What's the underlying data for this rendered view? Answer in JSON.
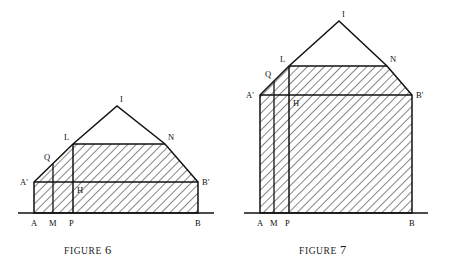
{
  "page": {
    "background": "#ffffff",
    "ink": "#111111",
    "hatch_color": "#2b2b2b",
    "width": 454,
    "height": 268
  },
  "figures": [
    {
      "id": "figure-6",
      "caption_prefix": "FIGURE",
      "caption_number": "6",
      "points": {
        "A": {
          "x": 34,
          "y": 213,
          "label": "A",
          "lx": 31,
          "ly": 226
        },
        "M": {
          "x": 53,
          "y": 213,
          "label": "M",
          "lx": 49,
          "ly": 226
        },
        "P": {
          "x": 73,
          "y": 213,
          "label": "P",
          "lx": 69,
          "ly": 226
        },
        "B": {
          "x": 198,
          "y": 213,
          "label": "B",
          "lx": 195,
          "ly": 226
        },
        "A2": {
          "x": 34,
          "y": 182,
          "label": "A'",
          "lx": 20,
          "ly": 185
        },
        "B2": {
          "x": 198,
          "y": 182,
          "label": "B'",
          "lx": 202,
          "ly": 185
        },
        "Q": {
          "x": 53,
          "y": 164,
          "label": "Q",
          "lx": 44,
          "ly": 160
        },
        "L": {
          "x": 73,
          "y": 144,
          "label": "L",
          "lx": 64,
          "ly": 140
        },
        "N": {
          "x": 165,
          "y": 144,
          "label": "N",
          "lx": 168,
          "ly": 140
        },
        "I": {
          "x": 117,
          "y": 106,
          "label": "I",
          "lx": 120,
          "ly": 102
        },
        "H": {
          "x": 73,
          "y": 182,
          "label": "H",
          "lx": 77,
          "ly": 193
        }
      },
      "baseline": {
        "x1": 18,
        "x2": 214,
        "y": 213
      },
      "shaded_polygon": "A,A2,L,N,B2,B",
      "unshaded_triangle": "L,I,N"
    },
    {
      "id": "figure-7",
      "caption_prefix": "FIGURE",
      "caption_number": "7",
      "points": {
        "A": {
          "x": 260,
          "y": 213,
          "label": "A",
          "lx": 257,
          "ly": 226
        },
        "M": {
          "x": 274,
          "y": 213,
          "label": "M",
          "lx": 270,
          "ly": 226
        },
        "P": {
          "x": 289,
          "y": 213,
          "label": "P",
          "lx": 285,
          "ly": 226
        },
        "B": {
          "x": 412,
          "y": 213,
          "label": "B",
          "lx": 409,
          "ly": 226
        },
        "A2": {
          "x": 260,
          "y": 95,
          "label": "A'",
          "lx": 246,
          "ly": 98
        },
        "B2": {
          "x": 412,
          "y": 95,
          "label": "B'",
          "lx": 416,
          "ly": 98
        },
        "Q": {
          "x": 274,
          "y": 81,
          "label": "Q",
          "lx": 265,
          "ly": 77
        },
        "L": {
          "x": 289,
          "y": 66,
          "label": "L",
          "lx": 280,
          "ly": 62
        },
        "N": {
          "x": 387,
          "y": 66,
          "label": "N",
          "lx": 390,
          "ly": 62
        },
        "I": {
          "x": 339,
          "y": 21,
          "label": "I",
          "lx": 342,
          "ly": 17
        },
        "H": {
          "x": 289,
          "y": 95,
          "label": "H",
          "lx": 293,
          "ly": 106
        }
      },
      "baseline": {
        "x1": 244,
        "x2": 428,
        "y": 213
      },
      "shaded_polygon": "A,A2,L,N,B2,B",
      "unshaded_triangle": "L,I,N"
    }
  ]
}
